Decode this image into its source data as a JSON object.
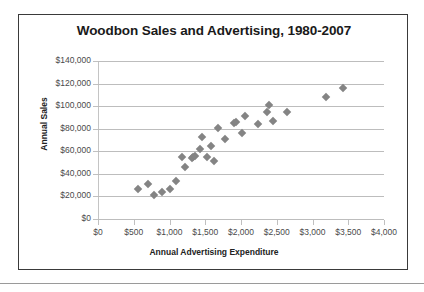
{
  "chart_data": {
    "type": "scatter",
    "title": "Woodbon Sales and Advertising, 1980-2007",
    "xlabel": "Annual Advertising Expenditure",
    "ylabel": "Annual Sales",
    "xlim": [
      0,
      4000
    ],
    "ylim": [
      0,
      140000
    ],
    "xticks": [
      0,
      500,
      1000,
      1500,
      2000,
      2500,
      3000,
      3500,
      4000
    ],
    "yticks": [
      0,
      20000,
      40000,
      60000,
      80000,
      100000,
      120000,
      140000
    ],
    "xticklabels": [
      "$0",
      "$500",
      "$1,000",
      "$1,500",
      "$2,000",
      "$2,500",
      "$3,000",
      "$3,500",
      "$4,000"
    ],
    "yticklabels": [
      "$0",
      "$20,000",
      "$40,000",
      "$60,000",
      "$80,000",
      "$100,000",
      "$120,000",
      "$140,000"
    ],
    "grid": "horizontal",
    "legend": "none",
    "marker": "diamond",
    "marker_color": "#848484",
    "points": [
      {
        "x": 560,
        "y": 27000
      },
      {
        "x": 700,
        "y": 31000
      },
      {
        "x": 790,
        "y": 21000
      },
      {
        "x": 890,
        "y": 24000
      },
      {
        "x": 1000,
        "y": 27000
      },
      {
        "x": 1090,
        "y": 34000
      },
      {
        "x": 1180,
        "y": 55000
      },
      {
        "x": 1210,
        "y": 46000
      },
      {
        "x": 1310,
        "y": 54000
      },
      {
        "x": 1330,
        "y": 55000
      },
      {
        "x": 1350,
        "y": 56000
      },
      {
        "x": 1420,
        "y": 62000
      },
      {
        "x": 1460,
        "y": 73000
      },
      {
        "x": 1520,
        "y": 55000
      },
      {
        "x": 1580,
        "y": 65000
      },
      {
        "x": 1620,
        "y": 51000
      },
      {
        "x": 1680,
        "y": 81000
      },
      {
        "x": 1780,
        "y": 71000
      },
      {
        "x": 1900,
        "y": 85000
      },
      {
        "x": 1930,
        "y": 86000
      },
      {
        "x": 2010,
        "y": 76000
      },
      {
        "x": 2060,
        "y": 91000
      },
      {
        "x": 2240,
        "y": 84000
      },
      {
        "x": 2370,
        "y": 95000
      },
      {
        "x": 2390,
        "y": 101000
      },
      {
        "x": 2450,
        "y": 87000
      },
      {
        "x": 2640,
        "y": 95000
      },
      {
        "x": 3190,
        "y": 108000
      },
      {
        "x": 3420,
        "y": 116000
      }
    ]
  }
}
